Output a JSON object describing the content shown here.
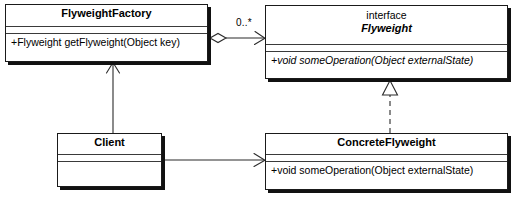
{
  "diagram": {
    "kind": "uml-class-diagram",
    "width": 517,
    "height": 200,
    "background_color": "#ffffff",
    "line_color": "#2b2b2b",
    "text_color": "#000000"
  },
  "classes": {
    "flyweight_factory": {
      "name": "FlyweightFactory",
      "stereotype": "",
      "operations": [
        "+Flyweight getFlyweight(Object key)"
      ]
    },
    "flyweight": {
      "name": "Flyweight",
      "stereotype": "interface",
      "operations": [
        "+void someOperation(Object externalState)"
      ]
    },
    "client": {
      "name": "Client",
      "stereotype": "",
      "operations": []
    },
    "concrete_flyweight": {
      "name": "ConcreteFlyweight",
      "stereotype": "",
      "operations": [
        "+void someOperation(Object externalState)"
      ]
    }
  },
  "relationships": {
    "factory_aggregates_flyweight": {
      "type": "aggregation",
      "from": "FlyweightFactory",
      "to": "Flyweight",
      "multiplicity_target": "0..*",
      "source_decoration": "hollow-diamond",
      "target_decoration": "open-arrow"
    },
    "concrete_realizes_flyweight": {
      "type": "realization",
      "from": "ConcreteFlyweight",
      "to": "Flyweight",
      "line_style": "dashed",
      "target_decoration": "hollow-triangle"
    },
    "client_uses_factory": {
      "type": "association",
      "from": "Client",
      "to": "FlyweightFactory",
      "line_style": "solid",
      "target_decoration": "open-arrow"
    },
    "client_uses_concrete_flyweight": {
      "type": "association",
      "from": "Client",
      "to": "ConcreteFlyweight",
      "line_style": "solid",
      "target_decoration": "open-arrow"
    }
  }
}
